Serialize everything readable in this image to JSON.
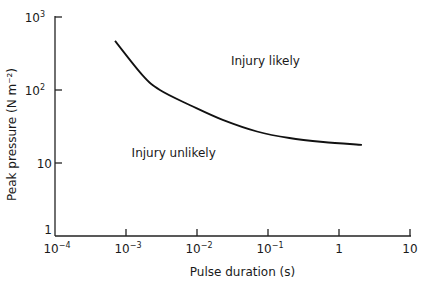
{
  "chart_data": {
    "type": "line",
    "title": "",
    "xlabel": "Pulse duration (s)",
    "ylabel": "Peak pressure (N m⁻²)",
    "xscale": "log",
    "yscale": "log",
    "xlim": [
      0.0001,
      10
    ],
    "ylim": [
      1,
      1000
    ],
    "grid": false,
    "x_ticks": [
      {
        "value": 0.0001,
        "base": "10",
        "exp": "−4"
      },
      {
        "value": 0.001,
        "base": "10",
        "exp": "−3"
      },
      {
        "value": 0.01,
        "base": "10",
        "exp": "−2"
      },
      {
        "value": 0.1,
        "base": "10",
        "exp": "−1"
      },
      {
        "value": 1,
        "base": "1",
        "exp": ""
      },
      {
        "value": 10,
        "base": "10",
        "exp": ""
      }
    ],
    "y_ticks": [
      {
        "value": 1,
        "base": "1",
        "exp": ""
      },
      {
        "value": 10,
        "base": "10",
        "exp": ""
      },
      {
        "value": 100,
        "base": "10",
        "exp": "2"
      },
      {
        "value": 1000,
        "base": "10",
        "exp": "3"
      }
    ],
    "series": [
      {
        "name": "Injury threshold",
        "x": [
          0.0007,
          0.0017,
          0.003,
          0.008,
          0.023,
          0.07,
          0.2,
          0.6,
          2.1
        ],
        "y": [
          470,
          160,
          100,
          62,
          39,
          27,
          22,
          19.4,
          17.7
        ]
      }
    ],
    "annotations": [
      {
        "text": "Injury likely",
        "x": 0.03,
        "y": 220
      },
      {
        "text": "Injury unlikely",
        "x": 0.0012,
        "y": 12
      }
    ]
  }
}
